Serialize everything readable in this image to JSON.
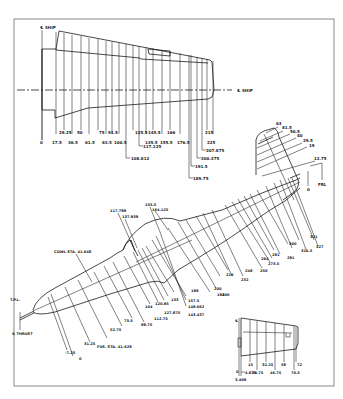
{
  "figure": {
    "frame_color": "#888888",
    "line_color": "#1a1a1a",
    "background": "#ffffff"
  },
  "wing": {
    "centerline_label_top": "℄ SHIP",
    "centerline_label_right": "℄ SHIP",
    "stations_row1": [
      "29.25",
      "50",
      "75",
      "91.5",
      "125.5",
      "145.5",
      "166",
      "215"
    ],
    "stations_row2": [
      "0",
      "17.5",
      "36.5",
      "61.5",
      "83.5",
      "100.5",
      "135.5",
      "155.5",
      "176.5",
      "225"
    ],
    "stations_leaders": [
      "117.125",
      "108.812",
      "207.875",
      "200.375",
      "191.5",
      "189.75"
    ]
  },
  "tail": {
    "stations": [
      "63",
      "81.5",
      "50.5",
      "40",
      "29.5",
      "19",
      "12.75",
      "0"
    ],
    "frl_label": "FRL"
  },
  "fuselage": {
    "top_labels": [
      "117.799",
      "137.939",
      "155.5",
      "164.125"
    ],
    "cowl_label": "COWL STA. 41.648",
    "fus_label": "FUS. STA. 41.629",
    "tp_label": "T.P.L.",
    "thrust_label": "℄ THRUST",
    "lower_left_labels": [
      "-7.25",
      "0",
      "31.25",
      "52.75",
      "73.5",
      "89.75"
    ],
    "lower_mid_labels": [
      "104",
      "112.75",
      "120.85",
      "127.875",
      "133",
      "157.5",
      "148.062",
      "143.437"
    ],
    "aft_labels": [
      "188",
      "194",
      "200",
      "206",
      "216",
      "232",
      "248",
      "256",
      "264",
      "273.5",
      "281",
      "291",
      "300",
      "311.5",
      "321",
      "327"
    ]
  },
  "stabilizer": {
    "centerline_label": "℄",
    "stations_row1": [
      "15",
      "32.25",
      "59",
      "72"
    ],
    "stations_row2": [
      "0",
      "24.75",
      "46.75",
      "70.5"
    ],
    "leaders": [
      "4.875",
      "3.469"
    ]
  }
}
